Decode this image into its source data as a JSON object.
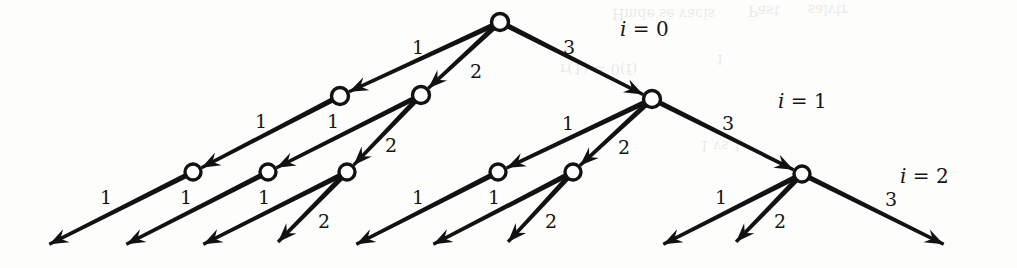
{
  "figure": {
    "kind": "ternary-decision-tree",
    "background": "#fdfdfb",
    "ink": "#121212",
    "width": 1017,
    "height": 268
  },
  "level_labels": [
    {
      "id": "i0",
      "text": "i = 0",
      "x": 620,
      "y": 19
    },
    {
      "id": "i1",
      "text": "i = 1",
      "x": 778,
      "y": 91
    },
    {
      "id": "i2",
      "text": "i = 2",
      "x": 900,
      "y": 166
    }
  ],
  "nodes": [
    {
      "id": "root",
      "level": 0,
      "x": 500,
      "y": 22,
      "r": 8.5
    },
    {
      "id": "n1a",
      "level": 1,
      "x": 340,
      "y": 96,
      "r": 8.5
    },
    {
      "id": "n1b",
      "level": 1,
      "x": 421,
      "y": 95,
      "r": 8.5
    },
    {
      "id": "n1c",
      "level": 1,
      "x": 652,
      "y": 99,
      "r": 8.5
    },
    {
      "id": "n2a",
      "level": 2,
      "x": 193,
      "y": 172,
      "r": 8
    },
    {
      "id": "n2b",
      "level": 2,
      "x": 268,
      "y": 172,
      "r": 8
    },
    {
      "id": "n2c",
      "level": 2,
      "x": 347,
      "y": 172,
      "r": 8
    },
    {
      "id": "n2d",
      "level": 2,
      "x": 498,
      "y": 172,
      "r": 8
    },
    {
      "id": "n2e",
      "level": 2,
      "x": 573,
      "y": 172,
      "r": 8
    },
    {
      "id": "n2f",
      "level": 2,
      "x": 802,
      "y": 174,
      "r": 8
    }
  ],
  "edges": [
    {
      "id": "e-root-1",
      "from": "root",
      "to": "n1a",
      "label": "1",
      "lx": 412,
      "ly": 38
    },
    {
      "id": "e-root-2",
      "from": "root",
      "to": "n1b",
      "label": "2",
      "lx": 470,
      "ly": 62
    },
    {
      "id": "e-root-3",
      "from": "root",
      "to": "n1c",
      "label": "3",
      "lx": 563,
      "ly": 38
    },
    {
      "id": "e-n1a-1",
      "from": "n1a",
      "to": "n2a",
      "label": "1",
      "lx": 255,
      "ly": 112
    },
    {
      "id": "e-n1b-1",
      "from": "n1b",
      "to": "n2b",
      "label": "1",
      "lx": 327,
      "ly": 112
    },
    {
      "id": "e-n1b-2",
      "from": "n1b",
      "to": "n2c",
      "label": "2",
      "lx": 385,
      "ly": 136
    },
    {
      "id": "e-n1c-1",
      "from": "n1c",
      "to": "n2d",
      "label": "1",
      "lx": 562,
      "ly": 114
    },
    {
      "id": "e-n1c-2",
      "from": "n1c",
      "to": "n2e",
      "label": "2",
      "lx": 618,
      "ly": 138
    },
    {
      "id": "e-n1c-3",
      "from": "n1c",
      "to": "n2f",
      "label": "3",
      "lx": 722,
      "ly": 114
    },
    {
      "id": "e-n2a-1",
      "from": "n2a",
      "to": "t1",
      "label": "1",
      "lx": 100,
      "ly": 188
    },
    {
      "id": "e-n2b-1",
      "from": "n2b",
      "to": "t2",
      "label": "1",
      "lx": 180,
      "ly": 188
    },
    {
      "id": "e-n2c-1",
      "from": "n2c",
      "to": "t3",
      "label": "1",
      "lx": 258,
      "ly": 188
    },
    {
      "id": "e-n2c-2",
      "from": "n2c",
      "to": "t4",
      "label": "2",
      "lx": 318,
      "ly": 212
    },
    {
      "id": "e-n2d-1",
      "from": "n2d",
      "to": "t5",
      "label": "1",
      "lx": 412,
      "ly": 188
    },
    {
      "id": "e-n2e-1",
      "from": "n2e",
      "to": "t6",
      "label": "1",
      "lx": 488,
      "ly": 188
    },
    {
      "id": "e-n2e-2",
      "from": "n2e",
      "to": "t7",
      "label": "2",
      "lx": 545,
      "ly": 212
    },
    {
      "id": "e-n2f-1",
      "from": "n2f",
      "to": "t8",
      "label": "1",
      "lx": 715,
      "ly": 188
    },
    {
      "id": "e-n2f-2",
      "from": "n2f",
      "to": "t9",
      "label": "2",
      "lx": 774,
      "ly": 212
    },
    {
      "id": "e-n2f-3",
      "from": "n2f",
      "to": "t10",
      "label": "3",
      "lx": 885,
      "ly": 190
    }
  ],
  "terminals": [
    {
      "id": "t1",
      "x": 48,
      "y": 245
    },
    {
      "id": "t2",
      "x": 125,
      "y": 245
    },
    {
      "id": "t3",
      "x": 202,
      "y": 245
    },
    {
      "id": "t4",
      "x": 277,
      "y": 243
    },
    {
      "id": "t5",
      "x": 355,
      "y": 245
    },
    {
      "id": "t6",
      "x": 432,
      "y": 245
    },
    {
      "id": "t7",
      "x": 507,
      "y": 243
    },
    {
      "id": "t8",
      "x": 662,
      "y": 245
    },
    {
      "id": "t9",
      "x": 735,
      "y": 243
    },
    {
      "id": "t10",
      "x": 945,
      "y": 245
    }
  ],
  "bleed_through": [
    {
      "text": "Past",
      "x": 748,
      "y": 2,
      "size": 15
    },
    {
      "text": "salvtr",
      "x": 808,
      "y": 2,
      "size": 14
    },
    {
      "text": "Hmde se vacis",
      "x": 612,
      "y": 6,
      "size": 14
    },
    {
      "text": "1",
      "x": 716,
      "y": 52,
      "size": 13
    },
    {
      "text": "r(1) = 0(f)",
      "x": 560,
      "y": 60,
      "size": 15
    },
    {
      "text": "1 vs  1",
      "x": 700,
      "y": 138,
      "size": 14
    }
  ]
}
